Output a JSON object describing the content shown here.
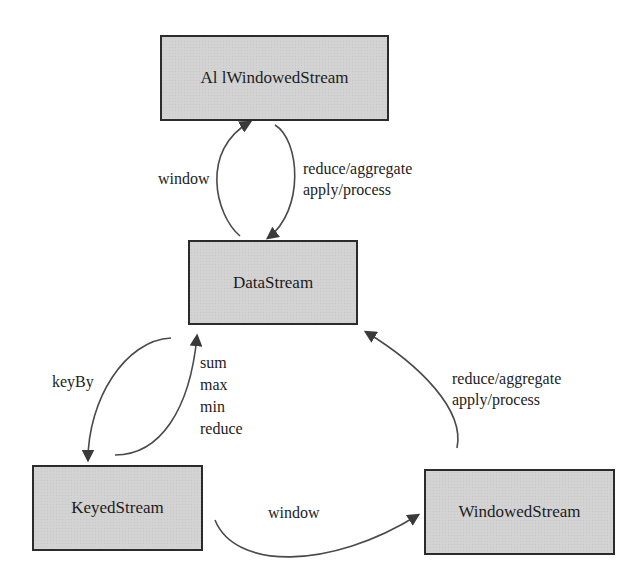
{
  "diagram": {
    "nodes": {
      "all_windowed_stream": "Al lWindowedStream",
      "data_stream": "DataStream",
      "keyed_stream": "KeyedStream",
      "windowed_stream": "WindowedStream"
    },
    "edges": {
      "datastream_to_allwindowed": "window",
      "allwindowed_to_datastream": [
        "reduce/aggregate",
        "apply/process"
      ],
      "datastream_to_keyed": "keyBy",
      "keyed_to_datastream": [
        "sum",
        "max",
        "min",
        "reduce"
      ],
      "keyed_to_windowed": "window",
      "windowed_to_datastream": [
        "reduce/aggregate",
        "apply/process"
      ]
    },
    "colors": {
      "box_fill": "#d3d3d3",
      "box_border": "#2b2b2b",
      "arrow": "#4a4a4a",
      "background": "#ffffff"
    }
  }
}
